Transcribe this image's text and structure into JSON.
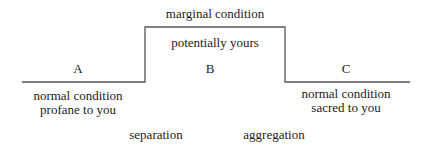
{
  "diagram": {
    "top_label": "marginal condition",
    "middle_label": "potentially yours",
    "phase_a": "A",
    "phase_b": "B",
    "phase_c": "C",
    "a_desc_line1": "normal condition",
    "a_desc_line2": "profane to you",
    "c_desc_line1": "normal condition",
    "c_desc_line2": "sacred to you",
    "transition_1": "separation",
    "transition_2": "aggregation",
    "line_color": "#555555"
  }
}
